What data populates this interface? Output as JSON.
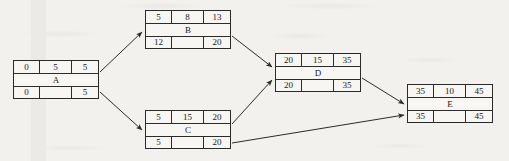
{
  "diagram": {
    "background_color": "#f3f1ee",
    "line_color": "#2b2b2b",
    "nodes": [
      {
        "id": "A",
        "label": "A",
        "early_start": "0",
        "duration": "5",
        "early_finish": "5",
        "late_start": "0",
        "slack": "",
        "late_finish": "5",
        "x": 13,
        "y": 60,
        "w": 86,
        "h": 39
      },
      {
        "id": "B",
        "label": "B",
        "early_start": "5",
        "duration": "8",
        "early_finish": "13",
        "late_start": "12",
        "slack": "",
        "late_finish": "20",
        "x": 145,
        "y": 10,
        "w": 86,
        "h": 39
      },
      {
        "id": "C",
        "label": "C",
        "early_start": "5",
        "duration": "15",
        "early_finish": "20",
        "late_start": "5",
        "slack": "",
        "late_finish": "20",
        "x": 145,
        "y": 110,
        "w": 86,
        "h": 39
      },
      {
        "id": "D",
        "label": "D",
        "early_start": "20",
        "duration": "15",
        "early_finish": "35",
        "late_start": "20",
        "slack": "",
        "late_finish": "35",
        "x": 275,
        "y": 53,
        "w": 86,
        "h": 39
      },
      {
        "id": "E",
        "label": "E",
        "early_start": "35",
        "duration": "10",
        "early_finish": "45",
        "late_start": "35",
        "slack": "",
        "late_finish": "45",
        "x": 407,
        "y": 84,
        "w": 86,
        "h": 39
      }
    ],
    "edges": [
      {
        "from": "A",
        "to": "B",
        "path": "M 100,72 L 142,32"
      },
      {
        "from": "A",
        "to": "C",
        "path": "M 100,92 L 142,130"
      },
      {
        "from": "B",
        "to": "D",
        "path": "M 232,36 L 272,67"
      },
      {
        "from": "C",
        "to": "D",
        "path": "M 232,124 L 272,80"
      },
      {
        "from": "D",
        "to": "E",
        "path": "M 362,78 L 404,104"
      },
      {
        "from": "C",
        "to": "E",
        "path": "M 232,143 L 404,115"
      }
    ]
  }
}
